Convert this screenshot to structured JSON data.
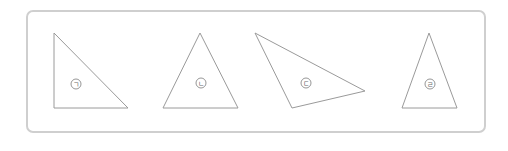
{
  "figure": {
    "frame": {
      "border_color": "#cfcfcf",
      "line_color": "#9a9a9a"
    },
    "triangles": [
      {
        "label": "ㄱ",
        "points": "54,33 54,108 128,108",
        "label_pos": [
          76,
          84
        ]
      },
      {
        "label": "ㄴ",
        "points": "200,33 163,108 238,108",
        "label_pos": [
          201,
          83
        ]
      },
      {
        "label": "ㄷ",
        "points": "255,33 365,91 292,108",
        "label_pos": [
          306,
          83
        ]
      },
      {
        "label": "ㄹ",
        "points": "429,33 402,108 457,108",
        "label_pos": [
          430,
          84
        ]
      }
    ]
  }
}
